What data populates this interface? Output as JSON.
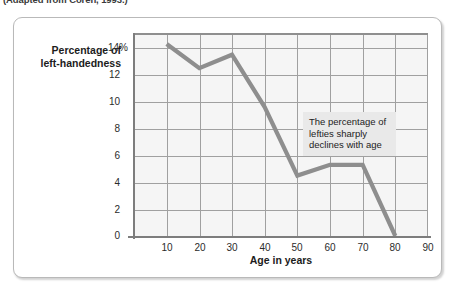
{
  "source_note": "(Adapted from Coren, 1993.)",
  "chart_data": {
    "type": "line",
    "title": "",
    "xlabel": "Age in years",
    "ylabel": "Percentage of left-handedness",
    "ylabel_line1": "Percentage of",
    "ylabel_line2": "left-handedness",
    "x": [
      10,
      20,
      30,
      40,
      50,
      60,
      70,
      80
    ],
    "values": [
      14.3,
      12.5,
      13.5,
      9.6,
      4.5,
      5.3,
      5.3,
      0.0
    ],
    "xlim": [
      0,
      90
    ],
    "ylim": [
      0,
      14
    ],
    "xticks": [
      "10",
      "20",
      "30",
      "40",
      "50",
      "60",
      "70",
      "80",
      "90"
    ],
    "yticks": [
      "0",
      "2",
      "4",
      "6",
      "8",
      "10",
      "12",
      "14%"
    ],
    "grid": true,
    "legend": "none",
    "line_color": "#8e8e8e",
    "plot_background": "#f5f5f5",
    "gridline_color": "#a0a0a0",
    "annotations": [
      {
        "name": "decline-callout",
        "text": "The percentage of lefties sharply declines with age"
      }
    ]
  }
}
